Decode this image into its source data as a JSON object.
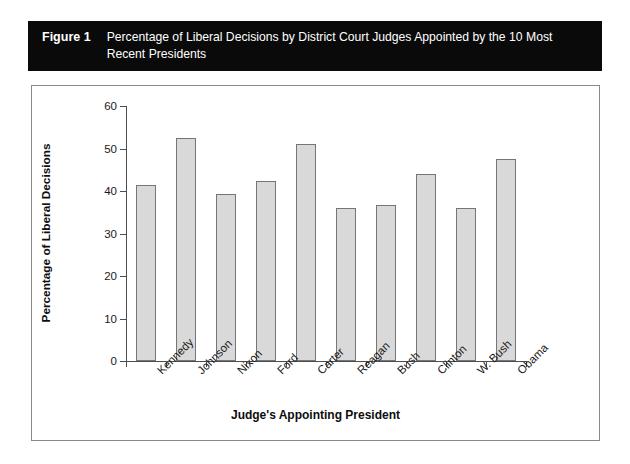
{
  "figure": {
    "number_label": "Figure 1",
    "caption": "Percentage of Liberal Decisions by District Court Judges Appointed by the 10 Most Recent Presidents",
    "caption_bar_color": "#0a0a0a",
    "caption_text_color": "#ffffff"
  },
  "chart_data": {
    "type": "bar",
    "title": "Percentage of Liberal Decisions by District Court Judges Appointed by the 10 Most Recent Presidents",
    "xlabel": "Judge's Appointing President",
    "ylabel": "Percentage of Liberal Decisions",
    "categories": [
      "Kennedy",
      "Johnson",
      "Nixon",
      "Ford",
      "Carter",
      "Reagan",
      "Bush",
      "Clinton",
      "W. Bush",
      "Obama"
    ],
    "values": [
      41.4,
      52.4,
      39.4,
      42.4,
      51.0,
      36.0,
      36.7,
      44.1,
      36.1,
      47.5
    ],
    "ylim": [
      0,
      60
    ],
    "yticks": [
      0,
      10,
      20,
      30,
      40,
      50,
      60
    ],
    "ytick_labels": [
      "0",
      "10",
      "20",
      "30",
      "40",
      "50",
      "60"
    ],
    "grid": false,
    "legend": null,
    "bar_fill_color": "#d9d9d9",
    "bar_border_color": "#767676",
    "axis_color": "#4d4d4d",
    "xlabel_rotation_deg": -45
  }
}
